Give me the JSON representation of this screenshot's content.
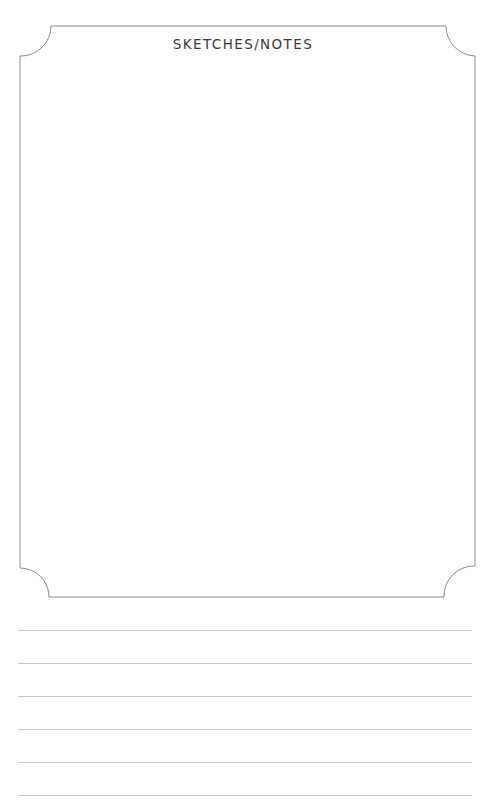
{
  "page": {
    "title": "SKETCHES/NOTES",
    "frame_color": "#8a8a8a",
    "rule_color": "#c8c8c8",
    "ruled_lines": [
      {
        "y": 630
      },
      {
        "y": 663
      },
      {
        "y": 696
      },
      {
        "y": 729
      },
      {
        "y": 762
      },
      {
        "y": 795
      }
    ]
  }
}
